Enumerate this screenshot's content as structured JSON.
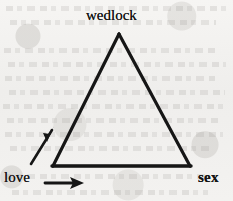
{
  "diagram": {
    "type": "triangle-relationship-diagram",
    "medium": "scanned book page",
    "stroke_color": "#141414",
    "paper_color": "#f2f1ef",
    "vertices": [
      {
        "id": "apex",
        "label": "wedlock",
        "x": 119,
        "y": 34
      },
      {
        "id": "bottom-left",
        "label": "love",
        "x": 53,
        "y": 166
      },
      {
        "id": "bottom-right",
        "label": "sex",
        "x": 190,
        "y": 166
      }
    ],
    "edges": [
      {
        "from": "bottom-left",
        "to": "apex",
        "name": "left-edge"
      },
      {
        "from": "apex",
        "to": "bottom-right",
        "name": "right-edge"
      },
      {
        "from": "bottom-left",
        "to": "bottom-right",
        "name": "base-edge"
      }
    ],
    "arrows": [
      {
        "id": "diagonal-arrow",
        "direction": "up-right",
        "from_x": 31,
        "from_y": 164,
        "to_x": 54,
        "to_y": 127,
        "meaning": "love toward wedlock"
      },
      {
        "id": "horizontal-arrow",
        "direction": "right",
        "from_x": 45,
        "from_y": 183,
        "to_x": 83,
        "to_y": 183,
        "meaning": "love toward sex"
      }
    ],
    "labels": {
      "apex": "wedlock",
      "bottom_left": "love",
      "bottom_right": "sex"
    }
  }
}
